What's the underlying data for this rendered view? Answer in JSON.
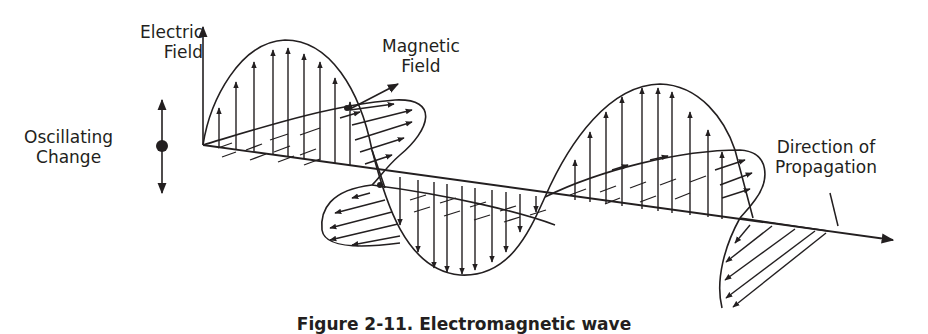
{
  "figure": {
    "caption": "Figure 2-11. Electromagnetic wave",
    "labels": {
      "electric_field": [
        "Electric",
        "Field"
      ],
      "magnetic_field": [
        "Magnetic",
        "Field"
      ],
      "oscillating_charge": [
        "Oscillating",
        "Change"
      ],
      "direction": [
        "Direction of",
        "Propagation"
      ]
    },
    "colors": {
      "ink": "#231f20",
      "background": "#ffffff"
    }
  }
}
